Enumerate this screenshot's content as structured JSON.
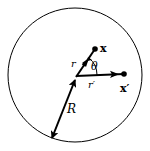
{
  "diagram": {
    "type": "geometry",
    "colors": {
      "stroke": "#000000",
      "background": "#ffffff"
    },
    "circle": {
      "cx": 75,
      "cy": 75,
      "r": 67
    },
    "origin": {
      "x": 76,
      "y": 77
    },
    "points": {
      "x": {
        "x": 95,
        "y": 49,
        "label": "x"
      },
      "x_prime": {
        "x": 124,
        "y": 74,
        "label": "x′"
      }
    },
    "radius_end": {
      "x": 52,
      "y": 138
    },
    "labels": {
      "r": "r",
      "r_prime": "r′",
      "theta": "θ",
      "R": "R",
      "x": "x",
      "x_prime": "x′"
    }
  }
}
